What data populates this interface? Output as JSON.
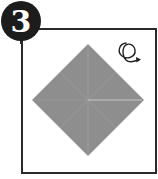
{
  "diagram": {
    "type": "origami-instruction-step",
    "step_number": "3",
    "symbols": [
      {
        "name": "turn-over-icon",
        "meaning": "turn the model over"
      }
    ],
    "model": {
      "shape": "square rotated 45° (diamond)",
      "fill_color": "#8e8e8e",
      "crease_color": "#b8b8b8",
      "creases": [
        "vertical center crease",
        "horizontal crease (right half)",
        "diagonal creases"
      ]
    },
    "colors": {
      "frame": "#2a2a2a",
      "badge_background": "#1c1c1c",
      "badge_text": "#ffffff",
      "background": "#ffffff"
    }
  }
}
